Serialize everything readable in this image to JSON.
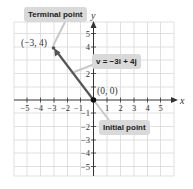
{
  "diagram": {
    "axes": {
      "x_label": "x",
      "y_label": "y",
      "x_ticks": [
        "-5",
        "-4",
        "-3",
        "-2",
        "-1",
        "1",
        "2",
        "3",
        "4",
        "5"
      ],
      "y_ticks": [
        "5",
        "4",
        "2",
        "1",
        "-1",
        "-2",
        "-3",
        "-4",
        "-5"
      ],
      "range": [
        -5,
        5
      ]
    },
    "points": {
      "initial": {
        "label": "(0, 0)",
        "x": 0,
        "y": 0
      },
      "terminal": {
        "label": "(-3, 4)",
        "display": "(−3, 4)",
        "x": -3,
        "y": 4
      }
    },
    "callouts": {
      "terminal": "Terminal point",
      "vector": "v = −3i + 4j",
      "initial": "Initial point"
    },
    "colors": {
      "vector": "#555555",
      "grid": "#d8d8d8",
      "axis": "#333333",
      "callout_bg": "#d9d9d9",
      "leader": "#c8c8c8"
    }
  }
}
